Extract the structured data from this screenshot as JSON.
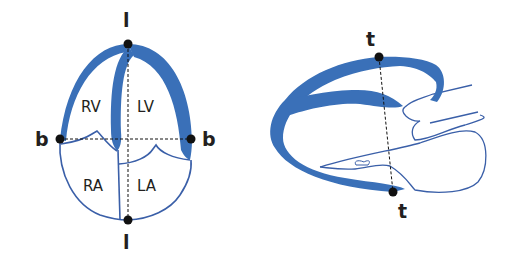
{
  "colors": {
    "myocardium": "#3a70b8",
    "outline": "#3a5fa8",
    "marker": "#111111",
    "text": "#231f20",
    "background": "#ffffff"
  },
  "left_diagram": {
    "view": "apical four-chamber",
    "chambers": {
      "rv": "RV",
      "lv": "LV",
      "ra": "RA",
      "la": "LA"
    },
    "points": {
      "top": "l",
      "bottom": "l",
      "left": "b",
      "right": "b"
    }
  },
  "right_diagram": {
    "view": "long-axis",
    "points": {
      "top": "t",
      "bottom": "t"
    }
  }
}
